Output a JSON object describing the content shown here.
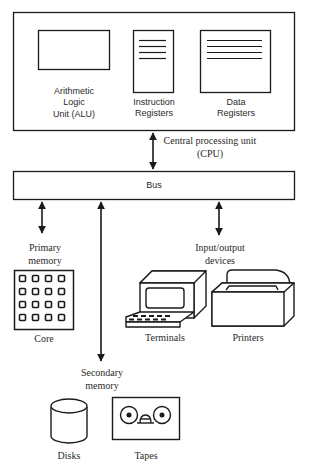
{
  "diagram": {
    "type": "computer-architecture-block-diagram",
    "cpu": {
      "label_line1": "Central processing unit",
      "label_line2": "(CPU)",
      "components": [
        {
          "name": "alu",
          "label_line1": "Arithmetic",
          "label_line2": "Logic",
          "label_line3": "Unit (ALU)"
        },
        {
          "name": "instruction-registers",
          "label_line1": "Instruction",
          "label_line2": "Registers"
        },
        {
          "name": "data-registers",
          "label_line1": "Data",
          "label_line2": "Registers"
        }
      ]
    },
    "bus": {
      "label": "Bus"
    },
    "primary_memory": {
      "label_line1": "Primary",
      "label_line2": "memory",
      "devices": [
        {
          "name": "core",
          "label": "Core",
          "grid": "4x4"
        }
      ]
    },
    "io_devices": {
      "label_line1": "Input/output",
      "label_line2": "devices",
      "devices": [
        {
          "name": "terminals",
          "label": "Terminals"
        },
        {
          "name": "printers",
          "label": "Printers"
        }
      ]
    },
    "secondary_memory": {
      "label_line1": "Secondary",
      "label_line2": "memory",
      "devices": [
        {
          "name": "disks",
          "label": "Disks"
        },
        {
          "name": "tapes",
          "label": "Tapes"
        }
      ]
    },
    "connections": [
      {
        "from": "cpu",
        "to": "bus",
        "bidirectional": true
      },
      {
        "from": "bus",
        "to": "primary_memory",
        "bidirectional": true
      },
      {
        "from": "bus",
        "to": "secondary_memory",
        "bidirectional": true
      },
      {
        "from": "bus",
        "to": "io_devices",
        "bidirectional": true
      }
    ],
    "colors": {
      "ink": "#1a1a1a",
      "background": "#ffffff"
    }
  }
}
